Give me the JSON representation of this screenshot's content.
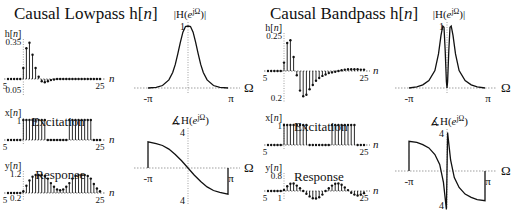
{
  "panels": {
    "lowpass": {
      "title_prefix": "Causal Lowpass h[",
      "title_var": "n",
      "title_suffix": "]"
    },
    "bandpass": {
      "title_prefix": "Causal Bandpass h[",
      "title_var": "n",
      "title_suffix": "]"
    }
  },
  "labels": {
    "excitation": "Excitation",
    "response": "Response",
    "n_axis": "n",
    "omega_axis": "Ω",
    "neg_pi": "-π",
    "pos_pi": "π",
    "h_label": "h[n]",
    "x_label": "x[n]",
    "y_label": "y[n]",
    "mag_label": "|H(e^jΩ)|",
    "phase_label": "∡H(e^jΩ)"
  },
  "chart_data": [
    {
      "id": "lowpass_h",
      "type": "stem",
      "title": "Causal Lowpass h[n]",
      "ylabel": "h[n]",
      "xlabel": "n",
      "x_ticks": [
        "5",
        "25"
      ],
      "y_ticks": [
        "0.35",
        "0.05"
      ],
      "x": [
        -5,
        -4,
        -3,
        -2,
        -1,
        0,
        1,
        2,
        3,
        4,
        5,
        6,
        7,
        8,
        9,
        10,
        11,
        12,
        13,
        14,
        15,
        16,
        17,
        18,
        19,
        20,
        21,
        22,
        23,
        24,
        25
      ],
      "values": [
        0,
        0,
        0,
        0,
        0,
        0.1,
        0.28,
        0.33,
        0.22,
        0.1,
        0.02,
        -0.02,
        -0.03,
        -0.02,
        -0.01,
        -0.005,
        0,
        0,
        0,
        0,
        0,
        0,
        0,
        0,
        0,
        0,
        0,
        0,
        0,
        0,
        0
      ]
    },
    {
      "id": "lowpass_x",
      "type": "stem",
      "title": "Excitation",
      "ylabel": "x[n]",
      "xlabel": "n",
      "x_ticks": [
        "5",
        "25"
      ],
      "y_ticks": [
        "1"
      ],
      "x": [
        -5,
        -4,
        -3,
        -2,
        -1,
        0,
        1,
        2,
        3,
        4,
        5,
        6,
        7,
        8,
        9,
        10,
        11,
        12,
        13,
        14,
        15,
        16,
        17,
        18,
        19,
        20,
        21,
        22,
        23,
        24,
        25
      ],
      "values": [
        0,
        0,
        0,
        0,
        0,
        1,
        1,
        1,
        1,
        1,
        1,
        1,
        1,
        0,
        0,
        0,
        0,
        0,
        0,
        0,
        1,
        1,
        1,
        1,
        1,
        1,
        1,
        1,
        0,
        0,
        0
      ]
    },
    {
      "id": "lowpass_y",
      "type": "stem",
      "title": "Response",
      "ylabel": "y[n]",
      "xlabel": "n",
      "x_ticks": [
        "5",
        "25"
      ],
      "y_ticks": [
        "1.2",
        "0.2"
      ],
      "x": [
        -5,
        -4,
        -3,
        -2,
        -1,
        0,
        1,
        2,
        3,
        4,
        5,
        6,
        7,
        8,
        9,
        10,
        11,
        12,
        13,
        14,
        15,
        16,
        17,
        18,
        19,
        20,
        21,
        22,
        23,
        24,
        25
      ],
      "values": [
        0,
        0,
        0,
        0,
        0,
        0.1,
        0.4,
        0.7,
        0.9,
        1.0,
        1.0,
        1.0,
        0.95,
        0.8,
        0.55,
        0.35,
        0.2,
        0.15,
        0.2,
        0.35,
        0.55,
        0.8,
        0.95,
        1.0,
        1.0,
        1.0,
        0.95,
        0.8,
        0.5,
        0.25,
        0.1
      ]
    },
    {
      "id": "lowpass_mag",
      "type": "line",
      "title": "|H(e^jΩ)|",
      "xlabel": "Ω",
      "x_ticks": [
        "-π",
        "π"
      ],
      "y_ticks": [
        "1"
      ],
      "x": [
        -3.14,
        -2.5,
        -2.0,
        -1.5,
        -1.2,
        -1.0,
        -0.8,
        -0.6,
        -0.4,
        -0.2,
        0,
        0.2,
        0.4,
        0.6,
        0.8,
        1.0,
        1.2,
        1.5,
        2.0,
        2.5,
        3.14
      ],
      "values": [
        0.0,
        0.01,
        0.04,
        0.13,
        0.25,
        0.38,
        0.55,
        0.74,
        0.9,
        0.99,
        1.0,
        0.99,
        0.9,
        0.74,
        0.55,
        0.38,
        0.25,
        0.13,
        0.04,
        0.01,
        0.0
      ]
    },
    {
      "id": "lowpass_phase",
      "type": "line",
      "title": "∡H(e^jΩ)",
      "xlabel": "Ω",
      "x_ticks": [
        "-π",
        "π"
      ],
      "y_ticks": [
        "4",
        "4"
      ],
      "x": [
        -3.14,
        -2.5,
        -2.0,
        -1.5,
        -1.0,
        -0.5,
        0,
        0.5,
        1.0,
        1.5,
        2.0,
        2.5,
        3.14
      ],
      "values": [
        2.9,
        2.7,
        2.5,
        2.1,
        1.5,
        0.8,
        0,
        -0.8,
        -1.5,
        -2.1,
        -2.5,
        -2.7,
        -2.9
      ]
    },
    {
      "id": "bandpass_h",
      "type": "stem",
      "title": "Causal Bandpass h[n]",
      "ylabel": "h[n]",
      "xlabel": "n",
      "x_ticks": [
        "5",
        "25"
      ],
      "y_ticks": [
        "0.25",
        "0.2"
      ],
      "x": [
        -5,
        -4,
        -3,
        -2,
        -1,
        0,
        1,
        2,
        3,
        4,
        5,
        6,
        7,
        8,
        9,
        10,
        11,
        12,
        13,
        14,
        15,
        16,
        17,
        18,
        19,
        20,
        21,
        22,
        23,
        24,
        25
      ],
      "values": [
        0,
        0,
        0,
        0,
        0,
        0.06,
        0.2,
        0.22,
        0.1,
        -0.03,
        -0.14,
        -0.18,
        -0.17,
        -0.13,
        -0.1,
        -0.07,
        -0.05,
        -0.035,
        -0.025,
        -0.015,
        -0.01,
        -0.005,
        0,
        0.005,
        0.01,
        0.012,
        0.013,
        0.013,
        0.012,
        0.01,
        0.01
      ]
    },
    {
      "id": "bandpass_x",
      "type": "stem",
      "title": "Excitation",
      "ylabel": "x[n]",
      "xlabel": "n",
      "x_ticks": [
        "5",
        "25"
      ],
      "y_ticks": [
        "1"
      ],
      "x": [
        -5,
        -4,
        -3,
        -2,
        -1,
        0,
        1,
        2,
        3,
        4,
        5,
        6,
        7,
        8,
        9,
        10,
        11,
        12,
        13,
        14,
        15,
        16,
        17,
        18,
        19,
        20,
        21,
        22,
        23,
        24,
        25
      ],
      "values": [
        0,
        0,
        0,
        0,
        0,
        1,
        1,
        1,
        1,
        1,
        1,
        1,
        1,
        0,
        0,
        0,
        0,
        0,
        0,
        0,
        1,
        1,
        1,
        1,
        1,
        1,
        1,
        1,
        0,
        0,
        0
      ]
    },
    {
      "id": "bandpass_y",
      "type": "stem",
      "title": "Response",
      "ylabel": "y[n]",
      "xlabel": "n",
      "x_ticks": [
        "5",
        "25"
      ],
      "y_ticks": [
        "0.8",
        "1"
      ],
      "x": [
        -5,
        -4,
        -3,
        -2,
        -1,
        0,
        1,
        2,
        3,
        4,
        5,
        6,
        7,
        8,
        9,
        10,
        11,
        12,
        13,
        14,
        15,
        16,
        17,
        18,
        19,
        20,
        21,
        22,
        23,
        24,
        25
      ],
      "values": [
        0,
        0,
        0,
        0,
        0,
        0.06,
        0.26,
        0.4,
        0.42,
        0.3,
        0.15,
        0.0,
        -0.15,
        -0.3,
        -0.4,
        -0.42,
        -0.35,
        -0.2,
        0.0,
        0.15,
        0.3,
        0.4,
        0.42,
        0.35,
        0.2,
        0.05,
        -0.1,
        -0.2,
        -0.25,
        -0.2,
        -0.12
      ]
    },
    {
      "id": "bandpass_mag",
      "type": "line",
      "title": "|H(e^jΩ)|",
      "xlabel": "Ω",
      "x_ticks": [
        "-π",
        "π"
      ],
      "y_ticks": [
        "1"
      ],
      "x": [
        -3.14,
        -2.5,
        -2.0,
        -1.5,
        -1.0,
        -0.7,
        -0.5,
        -0.35,
        -0.25,
        -0.15,
        -0.05,
        0,
        0.05,
        0.15,
        0.25,
        0.35,
        0.5,
        0.7,
        1.0,
        1.5,
        2.0,
        2.5,
        3.14
      ],
      "values": [
        0.0,
        0.02,
        0.05,
        0.12,
        0.28,
        0.55,
        0.85,
        1.0,
        0.98,
        0.6,
        0.1,
        0.0,
        0.1,
        0.6,
        0.98,
        1.0,
        0.85,
        0.55,
        0.28,
        0.12,
        0.05,
        0.02,
        0.0
      ]
    },
    {
      "id": "bandpass_phase",
      "type": "line",
      "title": "∡H(e^jΩ)",
      "xlabel": "Ω",
      "x_ticks": [
        "-π",
        "π"
      ],
      "y_ticks": [
        "4",
        "4"
      ],
      "x": [
        -3.14,
        -2.5,
        -2.0,
        -1.5,
        -1.0,
        -0.6,
        -0.3,
        -0.15,
        -0.05,
        0,
        0.05,
        0.15,
        0.3,
        0.6,
        1.0,
        1.5,
        2.0,
        2.5,
        3.14
      ],
      "values": [
        2.7,
        2.6,
        2.4,
        2.1,
        1.5,
        0.6,
        -1.0,
        -2.5,
        -3.5,
        0,
        3.5,
        2.5,
        1.0,
        -0.6,
        -1.5,
        -2.1,
        -2.4,
        -2.6,
        -2.7
      ]
    }
  ]
}
